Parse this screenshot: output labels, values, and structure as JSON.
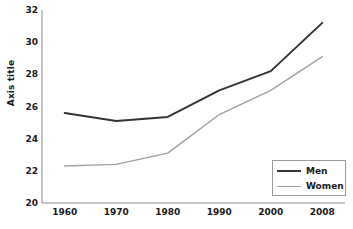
{
  "chart_data": {
    "type": "line",
    "title": "",
    "subtitle": "",
    "xlabel": "",
    "ylabel": "Axis title",
    "categories": [
      "1960",
      "1970",
      "1980",
      "1990",
      "2000",
      "2008"
    ],
    "series": [
      {
        "name": "Men",
        "values": [
          25.6,
          25.1,
          25.35,
          27.0,
          28.2,
          31.2
        ],
        "color": "#333333",
        "width": 2.0
      },
      {
        "name": "Women",
        "values": [
          22.3,
          22.4,
          23.1,
          25.5,
          27.0,
          29.1
        ],
        "color": "#a0a0a0",
        "width": 1.4
      }
    ],
    "ylim": [
      20,
      32
    ],
    "yticks": [
      20,
      22,
      24,
      26,
      28,
      30,
      32
    ],
    "ytick_labels": [
      "20",
      "22",
      "24",
      "26",
      "28",
      "30",
      "32"
    ],
    "xtick_labels": [
      "1960",
      "1970",
      "1980",
      "1990",
      "2000",
      "2008"
    ],
    "grid": false,
    "legend": {
      "position": "lower-right",
      "entries": [
        {
          "label": "Men"
        },
        {
          "label": "Women"
        }
      ]
    },
    "axis": {
      "left_px": 42,
      "right_px": 345,
      "top_px": 10,
      "bottom_px": 203,
      "spine_color": "#8c8c8c",
      "spine_width": 1
    },
    "background": "#ffffff"
  }
}
